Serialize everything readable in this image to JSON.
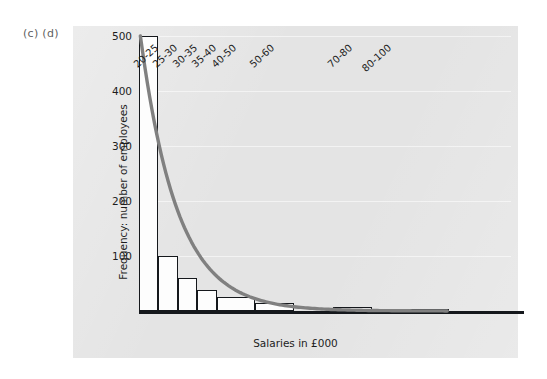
{
  "figure": {
    "label": "(c) (d)",
    "panel_color": "#e4e4e4",
    "curve_color": "#808080",
    "bar_fill": "#fdfdfd",
    "bar_outline": "#15181c"
  },
  "chart_data": {
    "type": "bar",
    "title": "",
    "subtitle": "",
    "xlabel": "Salaries in £000",
    "ylabel": "Frequency: number of employees",
    "categories": [
      "20-25",
      "25-30",
      "30-35",
      "35-40",
      "40-50",
      "50-60",
      "70-80",
      "80-100"
    ],
    "values": [
      500,
      100,
      60,
      38,
      25,
      14,
      7,
      3
    ],
    "class_lower": [
      20,
      25,
      30,
      35,
      40,
      50,
      70,
      80
    ],
    "class_upper": [
      25,
      30,
      35,
      40,
      50,
      60,
      80,
      100
    ],
    "class_widths": [
      5,
      5,
      5,
      5,
      10,
      10,
      20,
      20
    ],
    "ylim": [
      0,
      500
    ],
    "xlim": [
      20,
      100
    ],
    "yticks": [
      100,
      200,
      300,
      400,
      500
    ],
    "ytick_labels": [
      "100",
      "200",
      "300",
      "400",
      "500"
    ],
    "grid": true,
    "legend": "none",
    "annotations": [
      "(c) (d)"
    ],
    "overlay": {
      "type": "line",
      "name": "fitted frequency curve",
      "color": "#808080",
      "description": "smooth decreasing exponential-style curve drawn over the histogram"
    }
  }
}
